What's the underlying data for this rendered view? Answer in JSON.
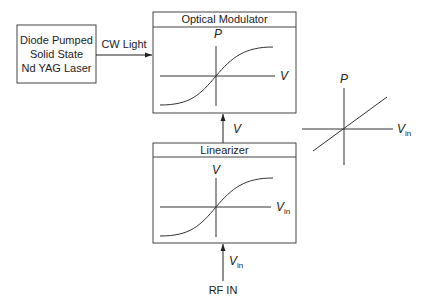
{
  "laser": {
    "lines": [
      "Diode Pumped",
      "Solid State",
      "Nd YAG Laser"
    ]
  },
  "cw_light_label": "CW Light",
  "optical_modulator": {
    "title": "Optical Modulator",
    "y_axis_label": "P",
    "x_axis_label": "V"
  },
  "link_label": "V",
  "linearizer": {
    "title": "Linearizer",
    "y_axis_label": "V",
    "x_axis_label_main": "V",
    "x_axis_label_sub": "in"
  },
  "input": {
    "arrow_label_main": "V",
    "arrow_label_sub": "in",
    "label": "RF IN"
  },
  "result_plot": {
    "y_axis_label": "P",
    "x_axis_label_main": "V",
    "x_axis_label_sub": "in"
  }
}
